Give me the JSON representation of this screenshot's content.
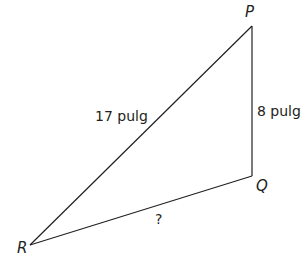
{
  "diagram": {
    "type": "triangle",
    "stroke_color": "#231f20",
    "vertices": {
      "P": {
        "label": "P",
        "x": 252,
        "y": 26
      },
      "Q": {
        "label": "Q",
        "x": 252,
        "y": 176
      },
      "R": {
        "label": "R",
        "x": 30,
        "y": 245
      }
    },
    "sides": {
      "PR": {
        "label": "17 pulg"
      },
      "PQ": {
        "label": "8 pulg"
      },
      "QR": {
        "label": "?"
      }
    }
  }
}
